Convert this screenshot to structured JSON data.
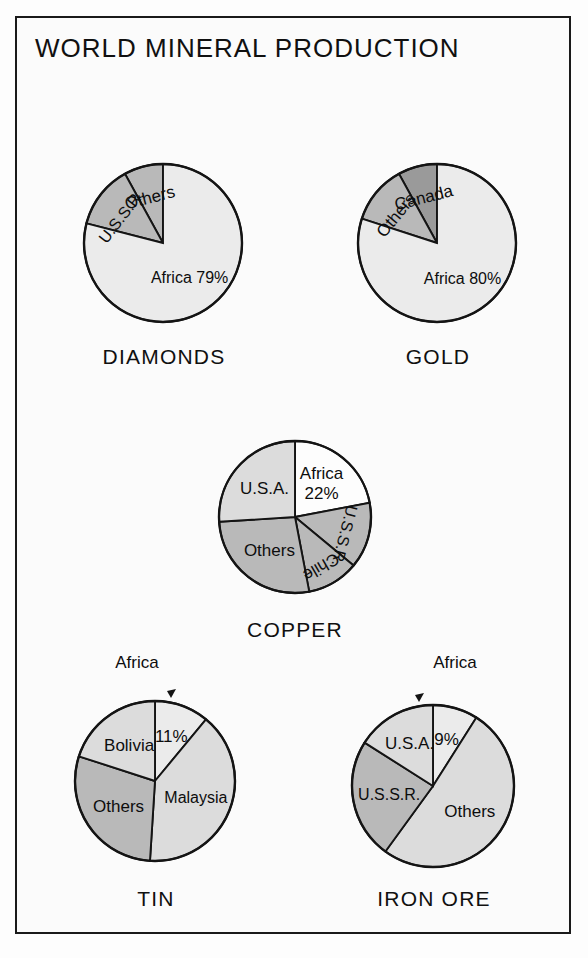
{
  "poster": {
    "title": "WORLD MINERAL PRODUCTION",
    "frame_color": "#1a1a1a",
    "background": "#fbfbfb"
  },
  "palette": {
    "white": "#fdfdfd",
    "lightest": "#ebebeb",
    "light": "#dcdcdc",
    "medium": "#b9b9b9",
    "dark": "#9a9a9a",
    "outline": "#141414"
  },
  "chart_data": [
    {
      "type": "pie",
      "title": "DIAMONDS",
      "caption": "DIAMONDS",
      "center": [
        163,
        243
      ],
      "radius": 79,
      "start_angle": 0,
      "direction": "counterclockwise",
      "slices": [
        {
          "label": "Others",
          "value": 8,
          "shade": "medium",
          "label_style": "radial"
        },
        {
          "label": "U.S.S.R.",
          "value": 13,
          "shade": "medium",
          "label_style": "radial"
        },
        {
          "label": "Africa 79%",
          "value": 79,
          "shade": "lightest",
          "label_style": "horizontal"
        }
      ]
    },
    {
      "type": "pie",
      "title": "GOLD",
      "caption": "GOLD",
      "center": [
        437,
        243
      ],
      "radius": 79,
      "start_angle": 0,
      "direction": "counterclockwise",
      "slices": [
        {
          "label": "Canada",
          "value": 8,
          "shade": "dark",
          "label_style": "radial"
        },
        {
          "label": "Others",
          "value": 12,
          "shade": "medium",
          "label_style": "radial"
        },
        {
          "label": "Africa 80%",
          "value": 80,
          "shade": "lightest",
          "label_style": "horizontal"
        }
      ]
    },
    {
      "type": "pie",
      "title": "COPPER",
      "caption": "COPPER",
      "center": [
        295,
        517
      ],
      "radius": 76,
      "start_angle": 0,
      "direction": "clockwise",
      "slices": [
        {
          "label": "Africa 22%",
          "value": 22,
          "shade": "white",
          "label_style": "two-line"
        },
        {
          "label": "U.S.S.R.",
          "value": 14,
          "shade": "medium",
          "label_style": "radial"
        },
        {
          "label": "Chile",
          "value": 11,
          "shade": "medium",
          "label_style": "radial"
        },
        {
          "label": "Others",
          "value": 27,
          "shade": "medium",
          "label_style": "horizontal"
        },
        {
          "label": "U.S.A.",
          "value": 26,
          "shade": "light",
          "label_style": "horizontal"
        }
      ]
    },
    {
      "type": "pie",
      "title": "TIN",
      "caption": "TIN",
      "center": [
        155,
        781
      ],
      "radius": 80,
      "start_angle": 0,
      "direction": "clockwise",
      "callout": {
        "label": "Africa",
        "x": 137,
        "y": 653
      },
      "slices": [
        {
          "label": "11%",
          "value": 11,
          "shade": "lightest",
          "label_style": "horizontal"
        },
        {
          "label": "Malaysia",
          "value": 40,
          "shade": "light",
          "label_style": "horizontal"
        },
        {
          "label": "Others",
          "value": 29,
          "shade": "medium",
          "label_style": "horizontal"
        },
        {
          "label": "Bolivia",
          "value": 20,
          "shade": "light",
          "label_style": "horizontal"
        }
      ]
    },
    {
      "type": "pie",
      "title": "IRON ORE",
      "caption": "IRON ORE",
      "center": [
        433,
        786
      ],
      "radius": 81,
      "start_angle": 0,
      "direction": "clockwise",
      "callout": {
        "label": "Africa",
        "x": 455,
        "y": 653
      },
      "slices": [
        {
          "label": "9%",
          "value": 9,
          "shade": "lightest",
          "label_style": "horizontal"
        },
        {
          "label": "Others",
          "value": 51,
          "shade": "light",
          "label_style": "horizontal"
        },
        {
          "label": "U.S.S.R.",
          "value": 24,
          "shade": "medium",
          "label_style": "horizontal"
        },
        {
          "label": "U.S.A.",
          "value": 16,
          "shade": "light",
          "label_style": "horizontal"
        }
      ]
    }
  ],
  "captions": {
    "diamonds": "DIAMONDS",
    "gold": "GOLD",
    "copper": "COPPER",
    "tin": "TIN",
    "iron_ore": "IRON ORE"
  },
  "caption_positions": [
    {
      "key": "diamonds",
      "x": 164,
      "y": 345
    },
    {
      "key": "gold",
      "x": 438,
      "y": 345
    },
    {
      "key": "copper",
      "x": 295,
      "y": 618
    },
    {
      "key": "tin",
      "x": 156,
      "y": 887
    },
    {
      "key": "iron_ore",
      "x": 434,
      "y": 887
    }
  ]
}
